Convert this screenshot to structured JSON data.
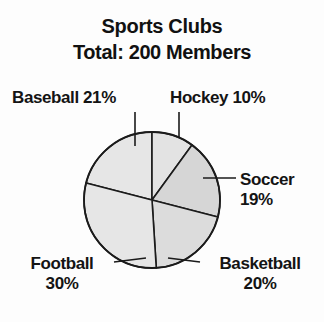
{
  "chart_data": {
    "type": "pie",
    "title": "Sports Clubs",
    "subtitle": "Total: 200 Members",
    "total_label": "Total: 200 Members",
    "total_value": 200,
    "total_unit": "Members",
    "xlabel": "",
    "ylabel": "",
    "grid": false,
    "legend_position": "none",
    "value_unit": "percent",
    "categories": [
      "Hockey",
      "Soccer",
      "Basketball",
      "Football",
      "Baseball"
    ],
    "values": [
      10,
      19,
      20,
      30,
      21
    ],
    "slices": [
      {
        "name": "Hockey",
        "value": 10,
        "value_text": "10%",
        "label_text": "Hockey 10%",
        "start_angle_deg": 0,
        "end_angle_deg": 36,
        "fill": "#e3e3e3",
        "label_lines": [
          "Hockey 10%"
        ],
        "label_position": "top-right"
      },
      {
        "name": "Soccer",
        "value": 19,
        "value_text": "19%",
        "label_text": "Soccer 19%",
        "start_angle_deg": 36,
        "end_angle_deg": 104.4,
        "fill": "#d6d6d6",
        "label_lines": [
          "Soccer",
          "19%"
        ],
        "label_position": "right"
      },
      {
        "name": "Basketball",
        "value": 20,
        "value_text": "20%",
        "label_text": "Basketball 20%",
        "start_angle_deg": 104.4,
        "end_angle_deg": 176.4,
        "fill": "#dcdcdc",
        "label_lines": [
          "Basketball",
          "20%"
        ],
        "label_position": "bottom-right"
      },
      {
        "name": "Football",
        "value": 30,
        "value_text": "30%",
        "label_text": "Football 30%",
        "start_angle_deg": 176.4,
        "end_angle_deg": 284.4,
        "fill": "#e6e6e6",
        "label_lines": [
          "Football",
          "30%"
        ],
        "label_position": "bottom-left"
      },
      {
        "name": "Baseball",
        "value": 21,
        "value_text": "21%",
        "label_text": "Baseball 21%",
        "start_angle_deg": 284.4,
        "end_angle_deg": 360,
        "fill": "#e6e6e6",
        "label_lines": [
          "Baseball 21%"
        ],
        "label_position": "top-left"
      }
    ],
    "colors": {
      "outline": "#1b1b1b",
      "text": "#141414",
      "background": "#fdfdfd",
      "slice_light": "#e6e6e6",
      "slice_mid": "#dcdcdc",
      "slice_dark": "#d6d6d6"
    }
  },
  "labels": {
    "baseball": "Baseball 21%",
    "hockey": "Hockey 10%",
    "soccer_line1": "Soccer",
    "soccer_line2": "19%",
    "football_line1": "Football",
    "football_line2": "30%",
    "basketball_line1": "Basketball",
    "basketball_line2": "20%"
  }
}
